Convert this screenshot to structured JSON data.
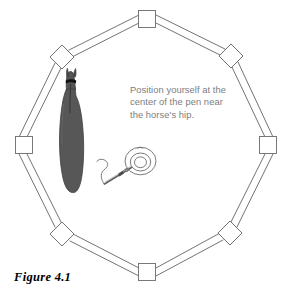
{
  "figure": {
    "caption": "Figure 4.1",
    "instruction": "Position yourself at the\ncenter of the pen near\nthe horse's hip.",
    "alt_title": "Round pen diagram with horse and handler"
  },
  "colors": {
    "background": "#ffffff",
    "fence_stroke": "#555555",
    "post_stroke": "#666666",
    "post_fill": "#ffffff",
    "horse_body": "#575757",
    "horse_outline": "#3a3a3a",
    "horse_mane": "#111111",
    "person_stroke": "#666666",
    "whip_stroke": "#5a5a5a",
    "instruction_text": "#7d7d7d",
    "caption_text": "#000000"
  },
  "pen": {
    "shape": "octagon",
    "panel_count": 8,
    "post_count": 8,
    "posts": [
      {
        "name": "post-top",
        "cx": 147,
        "cy": 19,
        "size": 17,
        "rotation": 0
      },
      {
        "name": "post-top-right",
        "cx": 231,
        "cy": 56,
        "size": 17,
        "rotation": 45
      },
      {
        "name": "post-right",
        "cx": 268,
        "cy": 145,
        "size": 17,
        "rotation": 0
      },
      {
        "name": "post-bottom-right",
        "cx": 230,
        "cy": 233,
        "size": 17,
        "rotation": 45
      },
      {
        "name": "post-bottom",
        "cx": 147,
        "cy": 272,
        "size": 17,
        "rotation": 0
      },
      {
        "name": "post-bottom-left",
        "cx": 62,
        "cy": 234,
        "size": 17,
        "rotation": 45
      },
      {
        "name": "post-left",
        "cx": 24,
        "cy": 145,
        "size": 17,
        "rotation": 0
      },
      {
        "name": "post-top-left",
        "cx": 62,
        "cy": 57,
        "size": 17,
        "rotation": 45
      }
    ]
  },
  "horse": {
    "label": "horse-silhouette",
    "view": "overhead",
    "position": {
      "x": 52,
      "y": 83,
      "width": 42,
      "height": 110
    }
  },
  "handler": {
    "label": "handler-figure",
    "view": "overhead",
    "position": {
      "x": 96,
      "y": 143,
      "width": 62,
      "height": 45
    },
    "props": [
      "whip",
      "lash"
    ]
  }
}
